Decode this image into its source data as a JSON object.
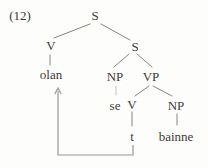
{
  "figure": {
    "number_label": "(12)",
    "type": "syntax-tree",
    "colors": {
      "background": "#fdfdfc",
      "text": "#3e3a36",
      "line": "#87847f",
      "faint_line": "#c7c5c0",
      "arrow": "#9b9894"
    },
    "number_pos": {
      "x": 20,
      "y": 16
    },
    "nodes": [
      {
        "id": "s-top",
        "label": "S",
        "x": 95,
        "y": 15
      },
      {
        "id": "v-upper",
        "label": "V",
        "x": 51,
        "y": 45
      },
      {
        "id": "s-lower",
        "label": "S",
        "x": 135,
        "y": 46
      },
      {
        "id": "olan",
        "label": "olan",
        "x": 51,
        "y": 74
      },
      {
        "id": "np-subject",
        "label": "NP",
        "x": 115,
        "y": 76
      },
      {
        "id": "vp",
        "label": "VP",
        "x": 151,
        "y": 76
      },
      {
        "id": "se",
        "label": "se",
        "x": 115,
        "y": 105
      },
      {
        "id": "v-lower",
        "label": "V",
        "x": 132,
        "y": 104
      },
      {
        "id": "np-object",
        "label": "NP",
        "x": 176,
        "y": 105
      },
      {
        "id": "t",
        "label": "t",
        "x": 132,
        "y": 136
      },
      {
        "id": "bainne",
        "label": "bainne",
        "x": 176,
        "y": 136
      }
    ],
    "edges": [
      {
        "from": "s-top",
        "to": "v-upper",
        "x1": 90,
        "y1": 24,
        "x2": 54,
        "y2": 38,
        "faint": false
      },
      {
        "from": "s-top",
        "to": "s-lower",
        "x1": 101,
        "y1": 24,
        "x2": 130,
        "y2": 40,
        "faint": false
      },
      {
        "from": "v-upper",
        "to": "olan",
        "x1": 50,
        "y1": 55,
        "x2": 50,
        "y2": 65,
        "faint": false
      },
      {
        "from": "s-lower",
        "to": "np-subject",
        "x1": 129,
        "y1": 54,
        "x2": 114,
        "y2": 67,
        "faint": false
      },
      {
        "from": "s-lower",
        "to": "vp",
        "x1": 137,
        "y1": 54,
        "x2": 152,
        "y2": 67,
        "faint": false
      },
      {
        "from": "np-subject",
        "to": "se",
        "x1": 116,
        "y1": 86,
        "x2": 116,
        "y2": 95,
        "faint": true
      },
      {
        "from": "vp",
        "to": "v-lower",
        "x1": 149,
        "y1": 86,
        "x2": 135,
        "y2": 96,
        "faint": false
      },
      {
        "from": "vp",
        "to": "np-object",
        "x1": 153,
        "y1": 86,
        "x2": 172,
        "y2": 96,
        "faint": false
      },
      {
        "from": "v-lower",
        "to": "t",
        "x1": 132,
        "y1": 112,
        "x2": 132,
        "y2": 126,
        "faint": false
      },
      {
        "from": "np-object",
        "to": "bainne",
        "x1": 177,
        "y1": 114,
        "x2": 177,
        "y2": 125,
        "faint": false
      }
    ],
    "movement_arrow": {
      "from": "t",
      "to": "olan",
      "path": [
        [
          133,
          145
        ],
        [
          133,
          155
        ],
        [
          58,
          155
        ],
        [
          58,
          91
        ]
      ],
      "head": {
        "tip_x": 58,
        "tip_y": 88,
        "arm_dx": 3.2,
        "arm_dy": 6
      }
    }
  }
}
